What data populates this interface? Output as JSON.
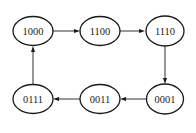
{
  "diagram": {
    "type": "state-transition-cycle",
    "nodes": [
      {
        "id": "n1000",
        "label": "1000",
        "cx": 33,
        "cy": 31
      },
      {
        "id": "n1100",
        "label": "1100",
        "cx": 100,
        "cy": 31
      },
      {
        "id": "n1110",
        "label": "1110",
        "cx": 165,
        "cy": 31
      },
      {
        "id": "n0001",
        "label": "0001",
        "cx": 165,
        "cy": 99
      },
      {
        "id": "n0011",
        "label": "0011",
        "cx": 100,
        "cy": 99
      },
      {
        "id": "n0111",
        "label": "0111",
        "cx": 33,
        "cy": 99
      }
    ],
    "edges": [
      {
        "from": "1000",
        "to": "1100"
      },
      {
        "from": "1100",
        "to": "1110"
      },
      {
        "from": "1110",
        "to": "0001"
      },
      {
        "from": "0001",
        "to": "0011"
      },
      {
        "from": "0011",
        "to": "0111"
      },
      {
        "from": "0111",
        "to": "1000"
      }
    ],
    "colors": {
      "stroke": "#1a1a1a",
      "text": "#222222",
      "background": "#ffffff"
    }
  }
}
